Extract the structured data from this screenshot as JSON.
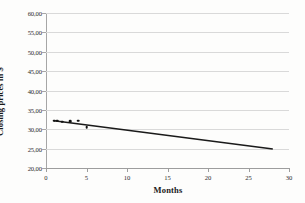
{
  "chart_data": {
    "type": "scatter",
    "title": "",
    "subtitle": "",
    "xlabel": "Months",
    "ylabel": "Closing prices in $",
    "xlim": [
      0,
      30
    ],
    "ylim": [
      20,
      60
    ],
    "x_ticks": [
      "0",
      "5",
      "10",
      "15",
      "20",
      "25",
      "30"
    ],
    "x_tick_values": [
      0,
      5,
      10,
      15,
      20,
      25,
      30
    ],
    "y_ticks": [
      "20,00",
      "25,00",
      "30,00",
      "35,00",
      "40,00",
      "45,00",
      "50,00",
      "55,00",
      "60,00"
    ],
    "y_tick_values": [
      20,
      25,
      30,
      35,
      40,
      45,
      50,
      55,
      60
    ],
    "grid": "horizontal",
    "legend": "none",
    "decimal_separator": ",",
    "series": [
      {
        "name": "Closing prices",
        "marker": "filled-circle",
        "color": "#111111",
        "points": [
          {
            "x": 1.0,
            "y": 32.2
          },
          {
            "x": 1.4,
            "y": 32.2
          },
          {
            "x": 2.0,
            "y": 32.0
          },
          {
            "x": 3.0,
            "y": 32.1
          },
          {
            "x": 4.0,
            "y": 32.2
          },
          {
            "x": 5.0,
            "y": 30.5
          }
        ]
      },
      {
        "name": "Linear trendline",
        "type": "line",
        "color": "#1a1a1a",
        "points": [
          {
            "x": 1.0,
            "y": 32.2
          },
          {
            "x": 28.0,
            "y": 24.9
          }
        ]
      }
    ],
    "colors": {
      "marker": "#111111",
      "trendline": "#1a1a1a",
      "gridline": "#d9d9d9",
      "axis": "#a6a6a6",
      "background": "#fdfdfc",
      "text": "#1a1a1a"
    }
  }
}
